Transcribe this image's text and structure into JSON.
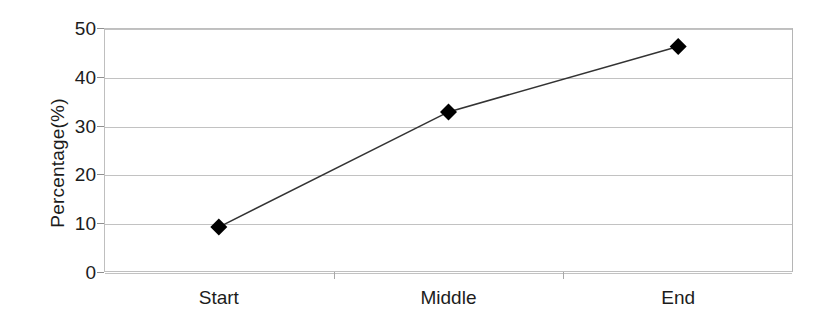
{
  "chart_data": {
    "type": "line",
    "title": "",
    "subtitle": "",
    "xlabel": "",
    "ylabel": "Percentage(%)",
    "categories": [
      "Start",
      "Middle",
      "End"
    ],
    "values": [
      9.2,
      32.8,
      46.2
    ],
    "series": [
      {
        "name": "Percentage",
        "values": [
          9.2,
          32.8,
          46.2
        ],
        "marker": "filled-diamond",
        "marker_color": "#000000",
        "line_color": "#333333"
      }
    ],
    "ylim": [
      0,
      50
    ],
    "ytick_labels": [
      "0",
      "10",
      "20",
      "30",
      "40",
      "50"
    ],
    "ytick_values": [
      0,
      10,
      20,
      30,
      40,
      50
    ],
    "grid": true,
    "grid_axis": "y",
    "legend": "none",
    "legend_position": "none",
    "annotations": [],
    "plot_background": "#ffffff",
    "grid_color": "#c2c2c2",
    "axis_color": "#bfbfbf",
    "text_color": "#1c1c1c"
  }
}
